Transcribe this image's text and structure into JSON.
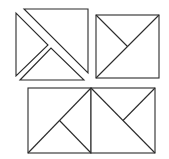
{
  "diagram": {
    "stroke_color": "#2b2b2b",
    "background": "#ffffff",
    "figures": [
      {
        "name": "top-left-exploded-square",
        "pieces": [
          {
            "name": "left-triangle",
            "points": "16,13 16,76 48,45"
          },
          {
            "name": "upper-right-triangle",
            "points": "24,9 88,9 88,73"
          },
          {
            "name": "bottom-triangle",
            "points": "20,80 51,48 84,80"
          }
        ]
      },
      {
        "name": "top-right-square",
        "rect": {
          "x": 96,
          "y": 15,
          "w": 63,
          "h": 63
        },
        "lines": [
          {
            "x1": 96,
            "y1": 78,
            "x2": 159,
            "y2": 15
          },
          {
            "x1": 96,
            "y1": 15,
            "x2": 127.5,
            "y2": 46.5
          }
        ]
      },
      {
        "name": "bottom-left-square",
        "rect": {
          "x": 28,
          "y": 88,
          "w": 63,
          "h": 65
        },
        "lines": [
          {
            "x1": 28,
            "y1": 153,
            "x2": 91,
            "y2": 88
          },
          {
            "x1": 59.5,
            "y1": 120.5,
            "x2": 91,
            "y2": 153
          }
        ]
      },
      {
        "name": "bottom-right-square",
        "rect": {
          "x": 91,
          "y": 88,
          "w": 64,
          "h": 65
        },
        "lines": [
          {
            "x1": 91,
            "y1": 88,
            "x2": 155,
            "y2": 153
          },
          {
            "x1": 123,
            "y1": 120.5,
            "x2": 155,
            "y2": 88
          }
        ]
      }
    ]
  }
}
